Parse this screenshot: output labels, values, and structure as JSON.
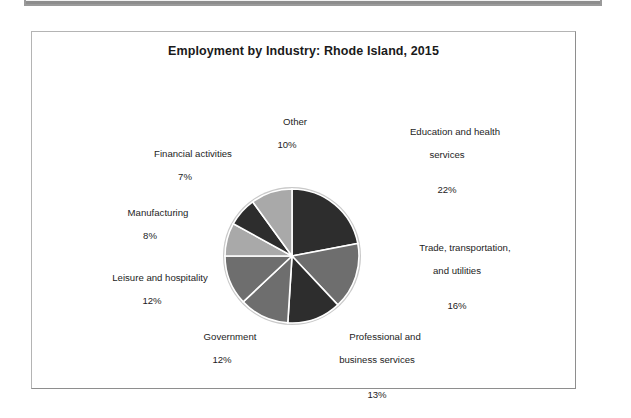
{
  "chart_data": {
    "type": "pie",
    "title": "Employment by Industry: Rhode Island, 2015",
    "xlabel": "",
    "ylabel": "",
    "legend_position": "none",
    "labels_outside": true,
    "start_angle_deg": 0,
    "direction": "clockwise",
    "categories": [
      "Education and health services",
      "Trade, transportation, and utilities",
      "Professional and business services",
      "Government",
      "Leisure and hospitality",
      "Manufacturing",
      "Financial activities",
      "Other"
    ],
    "values": [
      22,
      16,
      13,
      12,
      12,
      8,
      7,
      10
    ],
    "value_unit": "%",
    "colors": [
      "#2d2d2d",
      "#6e6e6e",
      "#2d2d2d",
      "#6e6e6e",
      "#6e6e6e",
      "#a9a9a9",
      "#2d2d2d",
      "#a9a9a9"
    ],
    "slices": [
      {
        "name": "Education and health services",
        "label_line1": "Education and health",
        "label_line2": "services",
        "percent": "22%",
        "value": 22,
        "color": "#2d2d2d"
      },
      {
        "name": "Trade, transportation, and utilities",
        "label_line1": "Trade, transportation,",
        "label_line2": "and utilities",
        "percent": "16%",
        "value": 16,
        "color": "#6e6e6e"
      },
      {
        "name": "Professional and business services",
        "label_line1": "Professional and",
        "label_line2": "business services",
        "percent": "13%",
        "value": 13,
        "color": "#2d2d2d"
      },
      {
        "name": "Government",
        "label_line1": "Government",
        "label_line2": "",
        "percent": "12%",
        "value": 12,
        "color": "#6e6e6e"
      },
      {
        "name": "Leisure and hospitality",
        "label_line1": "Leisure and hospitality",
        "label_line2": "",
        "percent": "12%",
        "value": 12,
        "color": "#6e6e6e"
      },
      {
        "name": "Manufacturing",
        "label_line1": "Manufacturing",
        "label_line2": "",
        "percent": "8%",
        "value": 8,
        "color": "#a9a9a9"
      },
      {
        "name": "Financial activities",
        "label_line1": "Financial activities",
        "label_line2": "",
        "percent": "7%",
        "value": 7,
        "color": "#2d2d2d"
      },
      {
        "name": "Other",
        "label_line1": "Other",
        "label_line2": "",
        "percent": "10%",
        "value": 10,
        "color": "#a9a9a9"
      }
    ]
  },
  "colors": {
    "dark": "#2d2d2d",
    "medium": "#6e6e6e",
    "light": "#a9a9a9",
    "frame_border": "#b4b4b4",
    "text": "#1d1d1d",
    "background": "#ffffff"
  }
}
